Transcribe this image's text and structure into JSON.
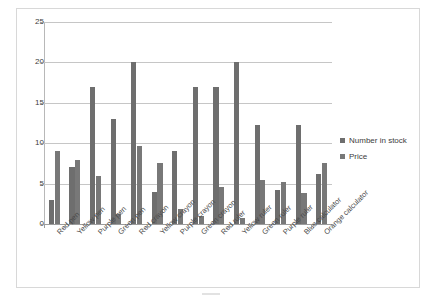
{
  "chart_data": {
    "type": "bar",
    "title": "",
    "xlabel": "",
    "ylabel": "",
    "ylim": [
      0,
      25
    ],
    "yticks": [
      0,
      5,
      10,
      15,
      20,
      25
    ],
    "grid": true,
    "legend_position": "right",
    "categories": [
      "Red pen",
      "Yellow pen",
      "Purple pen",
      "Green pen",
      "Red crayon",
      "Yellow crayon",
      "Purple crayon",
      "Green crayon",
      "Red ruler",
      "Yellow ruler",
      "Green ruler",
      "Purple ruler",
      "Blue calculator",
      "Orange calculator"
    ],
    "series": [
      {
        "name": "Number in stock",
        "color": "#6e6e6e",
        "values": [
          3,
          7,
          17,
          13,
          20,
          4,
          9,
          17,
          17,
          20,
          12.2,
          4.2,
          12.2,
          6.2
        ]
      },
      {
        "name": "Price",
        "color": "#787878",
        "values": [
          9,
          7.9,
          5.9,
          1.2,
          9.7,
          7.5,
          1.9,
          1,
          4.6,
          0.7,
          5.5,
          5.2,
          3.8,
          7.5
        ]
      }
    ]
  },
  "legend": {
    "items": [
      {
        "label": "Number in stock",
        "color": "#6e6e6e"
      },
      {
        "label": "Price",
        "color": "#787878"
      }
    ]
  },
  "axis": {
    "y_tick_labels": [
      "25",
      "20",
      "15",
      "10",
      "5",
      "0"
    ]
  }
}
